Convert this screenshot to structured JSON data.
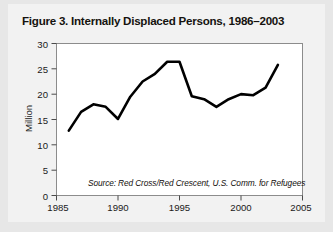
{
  "figure": {
    "title": "Figure 3. Internally Displaced Persons, 1986–2003",
    "source_note": "Source: Red Cross/Red Crescent, U.S. Comm. for Refugees"
  },
  "chart_data": {
    "type": "line",
    "title": "Figure 3. Internally Displaced Persons, 1986–2003",
    "xlabel": "",
    "ylabel": "Million",
    "xlim": [
      1985,
      2005
    ],
    "ylim": [
      0,
      30
    ],
    "xticks": [
      1985,
      1990,
      1995,
      2000,
      2005
    ],
    "yticks": [
      0,
      5,
      10,
      15,
      20,
      25,
      30
    ],
    "grid": false,
    "legend": "none",
    "line_color": "#000000",
    "line_width": 2.6,
    "annotations": [
      "Source: Red Cross/Red Crescent, U.S. Comm. for Refugees"
    ],
    "x": [
      1986,
      1987,
      1988,
      1989,
      1990,
      1991,
      1992,
      1993,
      1994,
      1995,
      1996,
      1997,
      1998,
      1999,
      2000,
      2001,
      2002,
      2003
    ],
    "values": [
      12.8,
      16.5,
      18.0,
      17.5,
      15.1,
      19.5,
      22.5,
      24.0,
      26.4,
      26.4,
      19.6,
      19.0,
      17.5,
      19.0,
      20.0,
      19.8,
      21.3,
      25.8
    ],
    "series": [
      {
        "name": "Internally Displaced Persons",
        "values": [
          12.8,
          16.5,
          18.0,
          17.5,
          15.1,
          19.5,
          22.5,
          24.0,
          26.4,
          26.4,
          19.6,
          19.0,
          17.5,
          19.0,
          20.0,
          19.8,
          21.3,
          25.8
        ]
      }
    ]
  },
  "axes": {
    "y_label": "Million",
    "y_tick_labels": [
      "30",
      "25",
      "20",
      "15",
      "10",
      "5",
      "0"
    ],
    "x_tick_labels": [
      "1985",
      "1990",
      "1995",
      "2000",
      "2005"
    ]
  },
  "colors": {
    "page_background": "#e7e7e7",
    "panel_background": "#f2f2f2",
    "plot_background": "#ffffff",
    "plot_border": "#8c8c8c",
    "line": "#000000",
    "text": "#15120f"
  }
}
